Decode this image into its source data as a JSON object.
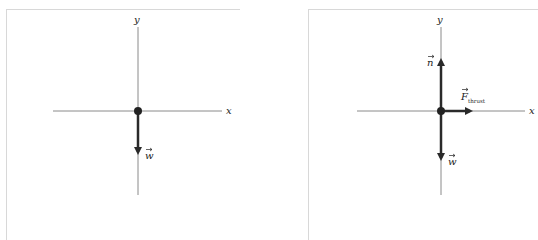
{
  "diagrams": [
    {
      "name": "free-body-diagram-1",
      "axes": {
        "x_label": "x",
        "y_label": "y"
      },
      "forces": [
        {
          "label": "w",
          "direction": "down"
        }
      ]
    },
    {
      "name": "free-body-diagram-2",
      "axes": {
        "x_label": "x",
        "y_label": "y"
      },
      "forces": [
        {
          "label": "n",
          "direction": "up"
        },
        {
          "label": "F",
          "subscript": "thrust",
          "direction": "right"
        },
        {
          "label": "w",
          "direction": "down"
        }
      ]
    }
  ],
  "colors": {
    "axis": "#8a8a8a",
    "vector": "#2a2a2a",
    "frame": "#d8d8d8",
    "dot": "#222222"
  }
}
